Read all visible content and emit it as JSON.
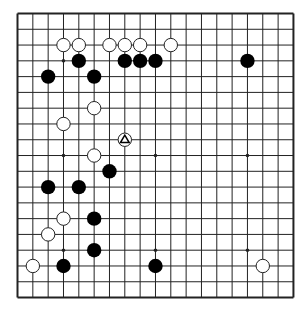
{
  "board": {
    "size": 19,
    "origin_x": 17.5,
    "origin_y": 13.5,
    "spacing_x": 15.33,
    "spacing_y": 15.78,
    "line_color": "#222222",
    "border_width": 2,
    "line_width": 1,
    "background": "#ffffff",
    "stone_radius": 7.2,
    "hoshi_radius": 1.8,
    "colors": {
      "black_stone": "#000000",
      "white_stone_fill": "#ffffff",
      "white_stone_stroke": "#222222",
      "marker": "#000000"
    }
  },
  "hoshi": [
    [
      3,
      3
    ],
    [
      9,
      3
    ],
    [
      15,
      3
    ],
    [
      3,
      9
    ],
    [
      9,
      9
    ],
    [
      15,
      9
    ],
    [
      3,
      15
    ],
    [
      9,
      15
    ],
    [
      15,
      15
    ]
  ],
  "stones": {
    "black": [
      [
        4,
        3
      ],
      [
        7,
        3
      ],
      [
        8,
        3
      ],
      [
        9,
        3
      ],
      [
        15,
        3
      ],
      [
        2,
        4
      ],
      [
        5,
        4
      ],
      [
        6,
        10
      ],
      [
        2,
        11
      ],
      [
        4,
        11
      ],
      [
        5,
        13
      ],
      [
        5,
        15
      ],
      [
        3,
        16
      ],
      [
        9,
        16
      ]
    ],
    "white": [
      [
        3,
        2
      ],
      [
        4,
        2
      ],
      [
        6,
        2
      ],
      [
        7,
        2
      ],
      [
        8,
        2
      ],
      [
        10,
        2
      ],
      [
        5,
        6
      ],
      [
        3,
        7
      ],
      [
        7,
        8
      ],
      [
        5,
        9
      ],
      [
        3,
        13
      ],
      [
        2,
        14
      ],
      [
        1,
        16
      ],
      [
        16,
        16
      ]
    ]
  },
  "markers": [
    {
      "type": "triangle",
      "col": 7,
      "row": 8,
      "on": "white"
    }
  ],
  "caption": "Go board position"
}
